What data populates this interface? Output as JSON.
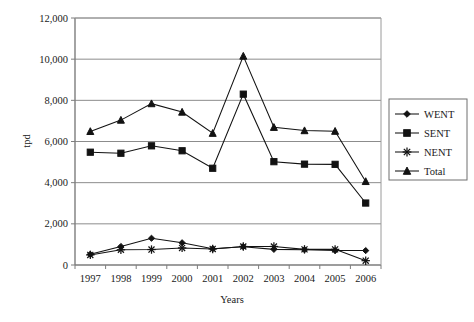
{
  "chart_data": {
    "type": "line",
    "title": "",
    "xlabel": "Years",
    "ylabel": "tpd",
    "categories": [
      "1997",
      "1998",
      "1999",
      "2000",
      "2001",
      "2002",
      "2003",
      "2004",
      "2005",
      "2006"
    ],
    "x": [
      1997,
      1998,
      1999,
      2000,
      2001,
      2002,
      2003,
      2004,
      2005,
      2006
    ],
    "ylim": [
      0,
      12000
    ],
    "xlim_labels": [
      "1997",
      "2006"
    ],
    "ytick_labels": [
      "0",
      "2,000",
      "4,000",
      "6,000",
      "8,000",
      "10,000",
      "12,000"
    ],
    "yticks": [
      0,
      2000,
      4000,
      6000,
      8000,
      10000,
      12000
    ],
    "grid": "horizontal",
    "legend_position": "right",
    "series": [
      {
        "name": "WENT",
        "marker": "diamond",
        "values": [
          520,
          900,
          1300,
          1080,
          790,
          890,
          760,
          740,
          700,
          700
        ]
      },
      {
        "name": "SENT",
        "marker": "square",
        "values": [
          5480,
          5430,
          5790,
          5550,
          4700,
          8300,
          5020,
          4900,
          4890,
          3010
        ]
      },
      {
        "name": "NENT",
        "marker": "asterisk",
        "values": [
          490,
          740,
          750,
          830,
          780,
          900,
          900,
          760,
          760,
          210
        ]
      },
      {
        "name": "Total",
        "marker": "triangle",
        "values": [
          6490,
          7040,
          7840,
          7430,
          6400,
          10150,
          6690,
          6530,
          6500,
          4060
        ]
      }
    ]
  },
  "legend": {
    "entries": [
      {
        "label": "WENT",
        "marker": "diamond-marker"
      },
      {
        "label": "SENT",
        "marker": "square-marker"
      },
      {
        "label": "NENT",
        "marker": "asterisk-marker"
      },
      {
        "label": "Total",
        "marker": "triangle-marker"
      }
    ]
  },
  "axes": {
    "y_title": "tpd",
    "x_title": "Years",
    "y_labels": [
      "12,000",
      "10,000",
      "8,000",
      "6,000",
      "4,000",
      "2,000",
      "0"
    ],
    "x_labels": [
      "1997",
      "1998",
      "1999",
      "2000",
      "2001",
      "2002",
      "2003",
      "2004",
      "2005",
      "2006"
    ]
  }
}
